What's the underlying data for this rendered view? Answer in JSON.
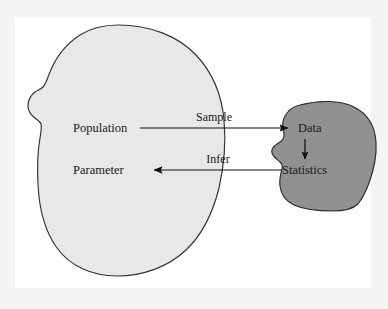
{
  "figure": {
    "width": 388,
    "height": 309
  },
  "colors": {
    "page_background": "#f4f4f4",
    "plate_background": "#ffffff",
    "population_fill": "#e8e8e8",
    "population_stroke": "#333333",
    "sample_fill": "#919191",
    "sample_stroke": "#2b2b2b",
    "text": "#1a1a1a",
    "arrow": "#111111"
  },
  "population_blob": {
    "name": "population-blob",
    "labels": {
      "population": "Population",
      "parameter": "Parameter"
    }
  },
  "sample_blob": {
    "name": "sample-blob",
    "labels": {
      "data": "Data",
      "statistics": "Statistics"
    }
  },
  "arrows": {
    "sample": {
      "label": "Sample",
      "direction": "right",
      "from": "Population",
      "to": "Data"
    },
    "infer": {
      "label": "Infer",
      "direction": "left",
      "from": "Statistics",
      "to": "Parameter"
    },
    "compute": {
      "label": "",
      "direction": "down",
      "from": "Data",
      "to": "Statistics"
    }
  }
}
